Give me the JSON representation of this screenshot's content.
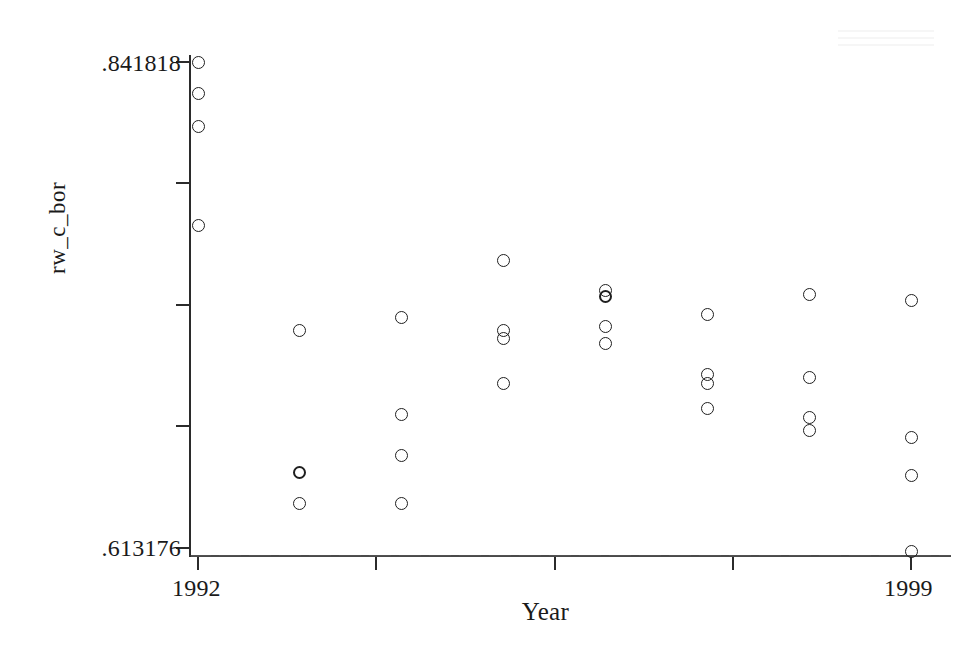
{
  "chart_data": {
    "type": "scatter",
    "title": "",
    "xlabel": "Year",
    "ylabel": "rw_c_bor",
    "xlim": [
      1992,
      1999
    ],
    "ylim": [
      0.613176,
      0.841818
    ],
    "grid": false,
    "legend": null,
    "y_tick_labels": [
      ".841818",
      ".613176"
    ],
    "y_tick_values": [
      0.841818,
      0.613176
    ],
    "y_tick_positions": [
      0.841818,
      0.784663,
      0.727508,
      0.670353,
      0.613176
    ],
    "x_tick_labels": [
      "1992",
      "1999"
    ],
    "x_tick_values": [
      1992,
      1999
    ],
    "x_tick_positions": [
      1992,
      1993.75,
      1995.5,
      1997.25,
      1999
    ],
    "marker": "open-circle",
    "points": [
      {
        "x": 1992,
        "y": 0.841818
      },
      {
        "x": 1992,
        "y": 0.8272
      },
      {
        "x": 1992,
        "y": 0.8116
      },
      {
        "x": 1992,
        "y": 0.7649
      },
      {
        "x": 1993,
        "y": 0.7156
      },
      {
        "x": 1993,
        "y": 0.6488,
        "overlap": true
      },
      {
        "x": 1993,
        "y": 0.6342
      },
      {
        "x": 1994,
        "y": 0.7217
      },
      {
        "x": 1994,
        "y": 0.676
      },
      {
        "x": 1994,
        "y": 0.6567
      },
      {
        "x": 1994,
        "y": 0.6342
      },
      {
        "x": 1995,
        "y": 0.7486
      },
      {
        "x": 1995,
        "y": 0.7156
      },
      {
        "x": 1995,
        "y": 0.7119
      },
      {
        "x": 1995,
        "y": 0.6907
      },
      {
        "x": 1996,
        "y": 0.7345
      },
      {
        "x": 1996,
        "y": 0.7317,
        "overlap": true
      },
      {
        "x": 1996,
        "y": 0.7175
      },
      {
        "x": 1996,
        "y": 0.7095
      },
      {
        "x": 1997,
        "y": 0.7231
      },
      {
        "x": 1997,
        "y": 0.6949
      },
      {
        "x": 1997,
        "y": 0.6907
      },
      {
        "x": 1997,
        "y": 0.679
      },
      {
        "x": 1998,
        "y": 0.7326
      },
      {
        "x": 1998,
        "y": 0.6935
      },
      {
        "x": 1998,
        "y": 0.6747
      },
      {
        "x": 1998,
        "y": 0.6686
      },
      {
        "x": 1999,
        "y": 0.7298
      },
      {
        "x": 1999,
        "y": 0.6653
      },
      {
        "x": 1999,
        "y": 0.6474
      },
      {
        "x": 1999,
        "y": 0.6117
      }
    ]
  },
  "axes": {
    "y_title": "rw_c_bor",
    "x_title": "Year",
    "y_max_label": ".841818",
    "y_min_label": ".613176",
    "x_min_label": "1992",
    "x_max_label": "1999"
  }
}
